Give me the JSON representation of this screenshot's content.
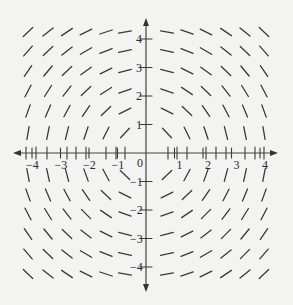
{
  "diagram": {
    "type": "slope_field",
    "title": "",
    "equation_depicted": "dy/dx = -x/y",
    "colors": {
      "background": "#f3f3f2",
      "line": "#3a3a3a",
      "axis": "#444444"
    },
    "axes": {
      "origin_px": [
        146,
        153
      ],
      "unit_px": 28.5,
      "x_range": [
        -4.5,
        4.5
      ],
      "y_range": [
        -4.5,
        4.5
      ],
      "x_ticks": [
        {
          "value": -4,
          "label": "−4"
        },
        {
          "value": -3,
          "label": "−3"
        },
        {
          "value": -2,
          "label": "−2"
        },
        {
          "value": -1,
          "label": "−1"
        },
        {
          "value": 1,
          "label": "1"
        },
        {
          "value": 2,
          "label": "2"
        },
        {
          "value": 3,
          "label": "3"
        },
        {
          "value": 4,
          "label": "4"
        }
      ],
      "y_ticks": [
        {
          "value": 4,
          "label": "4"
        },
        {
          "value": 3,
          "label": "3"
        },
        {
          "value": 2,
          "label": "2"
        },
        {
          "value": 1,
          "label": "1"
        },
        {
          "value": -1,
          "label": "−1"
        },
        {
          "value": -2,
          "label": "−2"
        },
        {
          "value": -3,
          "label": "−3"
        },
        {
          "value": -4,
          "label": "−4"
        }
      ],
      "origin_label": "0"
    },
    "grid": {
      "columns_px": [
        28,
        48,
        67,
        86,
        106,
        125,
        167,
        187,
        206,
        226,
        245,
        264
      ],
      "rows_px": [
        32,
        51,
        71,
        91,
        111,
        133,
        175,
        195,
        214,
        234,
        254,
        274
      ],
      "axis_marks_x_px": [
        26,
        36,
        47,
        67,
        76,
        86,
        106,
        116,
        125,
        168,
        177,
        187,
        206,
        216,
        226,
        245,
        255,
        264
      ],
      "segment_length_px": 13
    }
  }
}
